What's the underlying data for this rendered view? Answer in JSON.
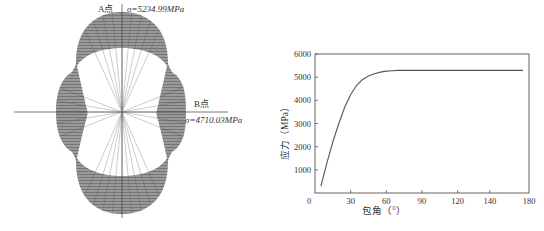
{
  "chart_data": [
    {
      "type": "diagram",
      "title": "",
      "description": "Polar stress distribution around wrap contour",
      "annotations": [
        {
          "label": "A点",
          "value_text": "σ=5234.99MPa",
          "position": "top"
        },
        {
          "label": "B点",
          "value_text": "σ=4710.03MPa",
          "position": "right"
        }
      ]
    },
    {
      "type": "line",
      "title": "",
      "xlabel": "包角（°）",
      "ylabel": "应力（MPa）",
      "xlim": [
        0,
        180
      ],
      "ylim": [
        0,
        6000
      ],
      "xticks": [
        0,
        30,
        60,
        90,
        120,
        140,
        180
      ],
      "yticks": [
        1000,
        2000,
        3000,
        4000,
        5000,
        6000
      ],
      "grid": false,
      "legend": null,
      "series": [
        {
          "name": "应力",
          "x": [
            5,
            10,
            15,
            20,
            25,
            30,
            35,
            40,
            45,
            50,
            55,
            60,
            65,
            70,
            80,
            90,
            120,
            150,
            175
          ],
          "y": [
            300,
            1300,
            2200,
            3000,
            3700,
            4250,
            4650,
            4900,
            5050,
            5150,
            5220,
            5260,
            5280,
            5290,
            5290,
            5290,
            5290,
            5290,
            5290
          ]
        }
      ]
    }
  ],
  "left": {
    "a_label": "A点",
    "a_value": "σ=5234.99MPa",
    "b_label": "B点",
    "b_value": "σ=4710.03MPa"
  },
  "right": {
    "xlabel": "包角（°）",
    "ylabel": "应力（MPa）",
    "xticks": [
      "0",
      "30",
      "60",
      "90",
      "120",
      "140",
      "180"
    ],
    "yticks": [
      "1000",
      "2000",
      "3000",
      "4000",
      "5000",
      "6000"
    ]
  },
  "colors": {
    "line": "#555555",
    "hatch": "#6e6e6e",
    "axis": "#555555"
  }
}
